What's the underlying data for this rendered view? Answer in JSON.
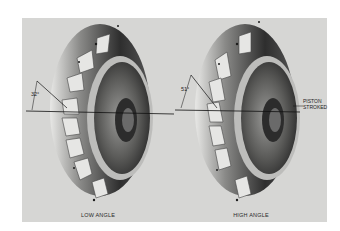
{
  "figure": {
    "panels": [
      {
        "id": "low",
        "angle_label": "32°",
        "caption": "LOW ANGLE"
      },
      {
        "id": "high",
        "angle_label": "51°",
        "caption": "HIGH ANGLE",
        "callout": [
          "PISTON",
          "STROKED"
        ]
      }
    ]
  },
  "colors": {
    "background": "#d6d6d4",
    "metal_dark": "#3a3a3a",
    "metal_light": "#c9c9c9",
    "line": "#111111"
  }
}
